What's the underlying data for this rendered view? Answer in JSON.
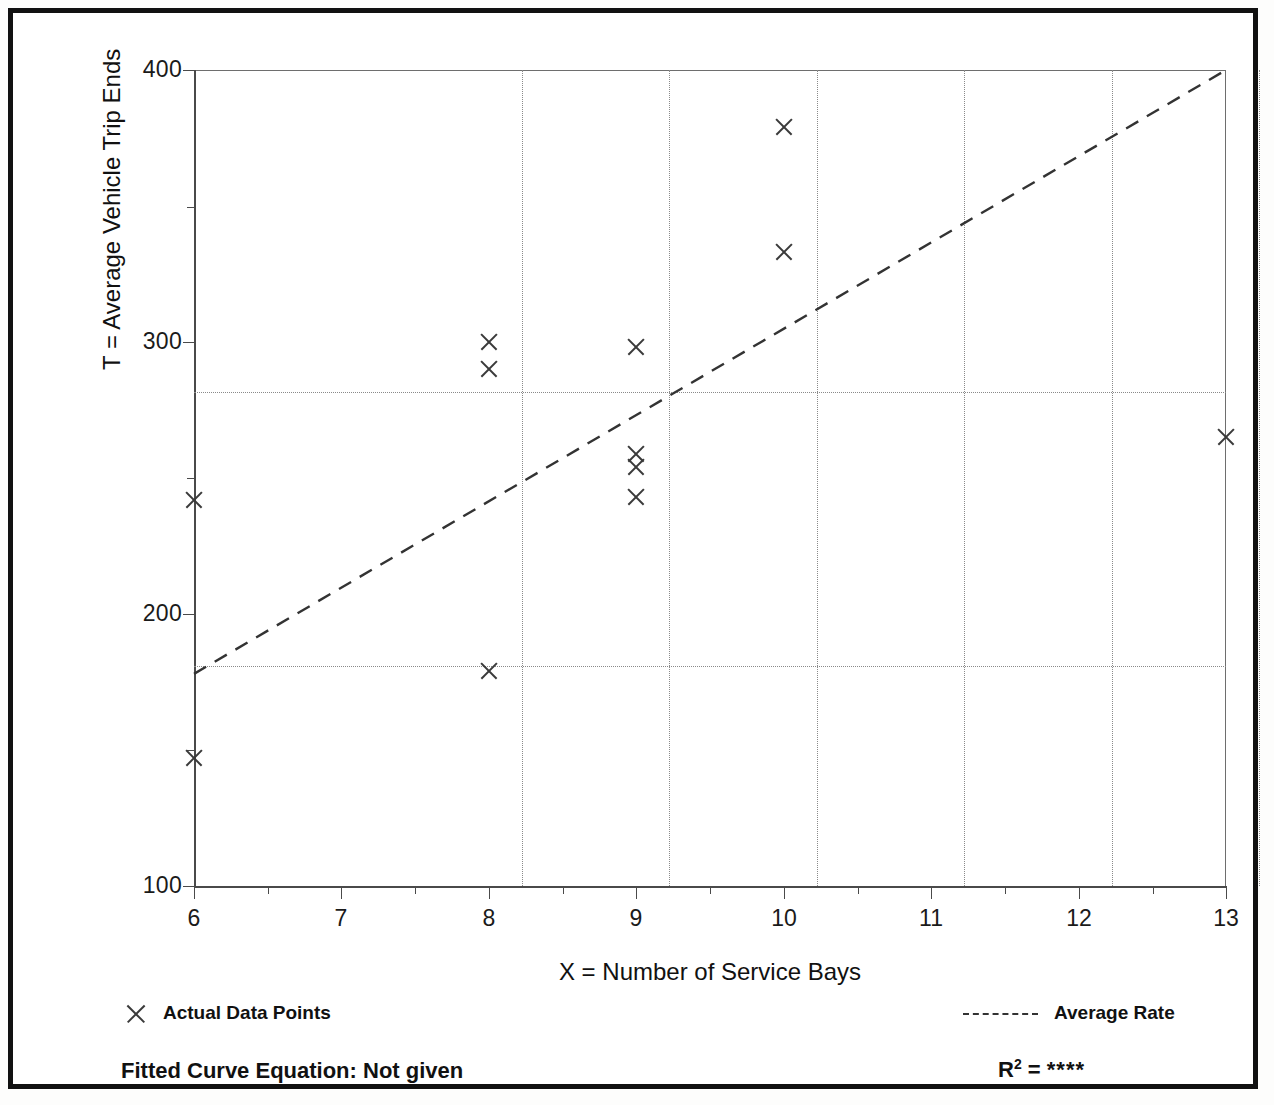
{
  "figure": {
    "border_color": "#111111",
    "background": "#ffffff"
  },
  "chart_data": {
    "type": "scatter",
    "title": "",
    "xlabel": "X = Number of Service Bays",
    "ylabel": "T = Average Vehicle Trip Ends",
    "xlim": [
      6,
      13
    ],
    "ylim": [
      100,
      400
    ],
    "grid": true,
    "x_ticks": [
      6,
      7,
      8,
      9,
      10,
      11,
      12,
      13
    ],
    "x_tick_labels": [
      "6",
      "7",
      "8",
      "9",
      "10",
      "11",
      "12",
      "13"
    ],
    "x_minor_ticks": [
      6.5,
      7.5,
      8.5,
      9.5,
      10.5,
      11.5,
      12.5
    ],
    "y_ticks": [
      100,
      200,
      300,
      400
    ],
    "y_tick_labels": [
      "100",
      "200",
      "300",
      "400"
    ],
    "y_minor_ticks": [
      150,
      250,
      350
    ],
    "gridlines_x": [
      7,
      8,
      9,
      10,
      11,
      12
    ],
    "gridlines_y": [
      200,
      300
    ],
    "series": [
      {
        "name": "Actual Data Points",
        "marker": "x",
        "color": "#3a3a3a",
        "points": [
          {
            "x": 6,
            "y": 242
          },
          {
            "x": 6,
            "y": 147
          },
          {
            "x": 8,
            "y": 300
          },
          {
            "x": 8,
            "y": 290
          },
          {
            "x": 8,
            "y": 179
          },
          {
            "x": 9,
            "y": 298
          },
          {
            "x": 9,
            "y": 259
          },
          {
            "x": 9,
            "y": 254
          },
          {
            "x": 9,
            "y": 243
          },
          {
            "x": 10,
            "y": 379
          },
          {
            "x": 10,
            "y": 333
          },
          {
            "x": 13,
            "y": 265
          }
        ]
      },
      {
        "name": "Average Rate",
        "type": "line",
        "style": "dashed",
        "color": "#333333",
        "endpoints": [
          {
            "x": 6,
            "y": 178
          },
          {
            "x": 13,
            "y": 400
          }
        ]
      }
    ],
    "legend_position": "below-axes",
    "annotations": {
      "fitted_curve_equation": "Fitted Curve Equation:  Not given",
      "r_squared_label": "R",
      "r_squared_exponent": "2",
      "r_squared_equals": "=",
      "r_squared_value": "****"
    }
  },
  "legend": {
    "left_entry_label": "Actual Data Points",
    "left_entry_marker": "x-marker-icon",
    "right_entry_label": "Average Rate",
    "right_entry_marker": "dashed-line-icon"
  }
}
